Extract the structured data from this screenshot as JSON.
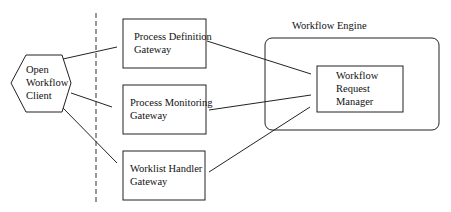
{
  "diagram": {
    "client": {
      "lines": [
        "Open",
        "Workflow",
        "Client"
      ]
    },
    "gateways": [
      {
        "lines": [
          "Process Definition",
          "Gateway"
        ]
      },
      {
        "lines": [
          "Process Monitoring",
          "Gateway"
        ]
      },
      {
        "lines": [
          "Worklist Handler",
          "Gateway"
        ]
      }
    ],
    "engine": {
      "title": "Workflow Engine",
      "manager": {
        "lines": [
          "Workflow",
          "Request",
          "Manager"
        ]
      }
    },
    "colors": {
      "stroke": "#222222",
      "background": "#ffffff"
    }
  }
}
